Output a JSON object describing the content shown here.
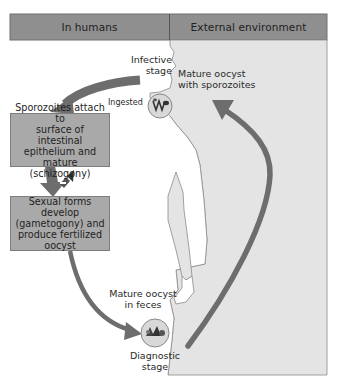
{
  "header": {
    "left_label": "In humans",
    "right_label": "External environment"
  },
  "labels": {
    "infective_stage": [
      "Infective",
      "stage"
    ],
    "ingested": "Ingested",
    "mature_oocyst_sporozoites": [
      "Mature oocyst",
      "with sporozoites"
    ],
    "mature_oocyst_feces": [
      "Mature oocyst",
      "in feces"
    ],
    "diagnostic_stage": [
      "Diagnostic",
      "stage"
    ]
  },
  "boxes": [
    {
      "lines": [
        "Sporozoites attach to",
        "surface of intestinal",
        "epithelium and mature",
        "(schizogony)"
      ]
    },
    {
      "lines": [
        "Sexual forms develop",
        "(gametogony) and",
        "produce fertilized",
        "oocyst"
      ]
    }
  ],
  "icons": {
    "ingested_circle": "oocyst-with-sporozoites-icon",
    "diagnostic_circle": "oocyst-in-feces-icon",
    "intermediate_forms": "parasite-forms-icon"
  },
  "colors": {
    "header_bar": "#8f8f8f",
    "box_fill": "#a9a9a9",
    "external_region": "#e4e4e4",
    "arrow": "#6d6d6d",
    "outline": "#7a7a7a"
  }
}
